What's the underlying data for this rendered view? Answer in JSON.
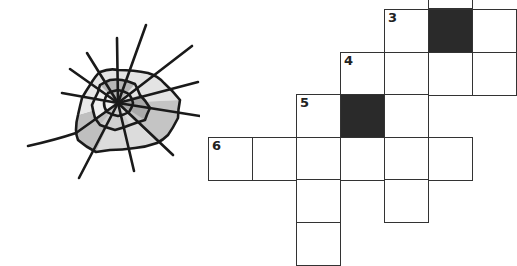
{
  "puzzle": {
    "type": "crossword",
    "decoration": "spider-web-icon",
    "colors": {
      "grid_line": "#333333",
      "black_cell": "#2a2a2a",
      "web_fill_light": "#e4e4e4",
      "web_fill_dark": "#b8b8b8",
      "web_stroke": "#1a1a1a"
    },
    "cells": [
      {
        "row": 0,
        "col": 5,
        "x": 428,
        "y": -35,
        "black": false,
        "number": ""
      },
      {
        "row": 1,
        "col": 4,
        "x": 384,
        "y": 9,
        "black": false,
        "number": "3"
      },
      {
        "row": 1,
        "col": 5,
        "x": 428,
        "y": 9,
        "black": true,
        "number": ""
      },
      {
        "row": 1,
        "col": 6,
        "x": 472,
        "y": 9,
        "black": false,
        "number": ""
      },
      {
        "row": 2,
        "col": 3,
        "x": 340,
        "y": 52,
        "black": false,
        "number": "4"
      },
      {
        "row": 2,
        "col": 4,
        "x": 384,
        "y": 52,
        "black": false,
        "number": ""
      },
      {
        "row": 2,
        "col": 5,
        "x": 428,
        "y": 52,
        "black": false,
        "number": ""
      },
      {
        "row": 2,
        "col": 6,
        "x": 472,
        "y": 52,
        "black": false,
        "number": ""
      },
      {
        "row": 3,
        "col": 2,
        "x": 296,
        "y": 94,
        "black": false,
        "number": "5"
      },
      {
        "row": 3,
        "col": 3,
        "x": 340,
        "y": 94,
        "black": true,
        "number": ""
      },
      {
        "row": 3,
        "col": 4,
        "x": 384,
        "y": 94,
        "black": false,
        "number": ""
      },
      {
        "row": 4,
        "col": 0,
        "x": 208,
        "y": 137,
        "black": false,
        "number": "6"
      },
      {
        "row": 4,
        "col": 1,
        "x": 252,
        "y": 137,
        "black": false,
        "number": ""
      },
      {
        "row": 4,
        "col": 2,
        "x": 296,
        "y": 137,
        "black": false,
        "number": ""
      },
      {
        "row": 4,
        "col": 3,
        "x": 340,
        "y": 137,
        "black": false,
        "number": ""
      },
      {
        "row": 4,
        "col": 4,
        "x": 384,
        "y": 137,
        "black": false,
        "number": ""
      },
      {
        "row": 4,
        "col": 5,
        "x": 428,
        "y": 137,
        "black": false,
        "number": ""
      },
      {
        "row": 5,
        "col": 2,
        "x": 296,
        "y": 179,
        "black": false,
        "number": ""
      },
      {
        "row": 5,
        "col": 4,
        "x": 384,
        "y": 179,
        "black": false,
        "number": ""
      },
      {
        "row": 6,
        "col": 2,
        "x": 296,
        "y": 222,
        "black": false,
        "number": ""
      }
    ],
    "clue_numbers": [
      "3",
      "4",
      "5",
      "6"
    ]
  }
}
